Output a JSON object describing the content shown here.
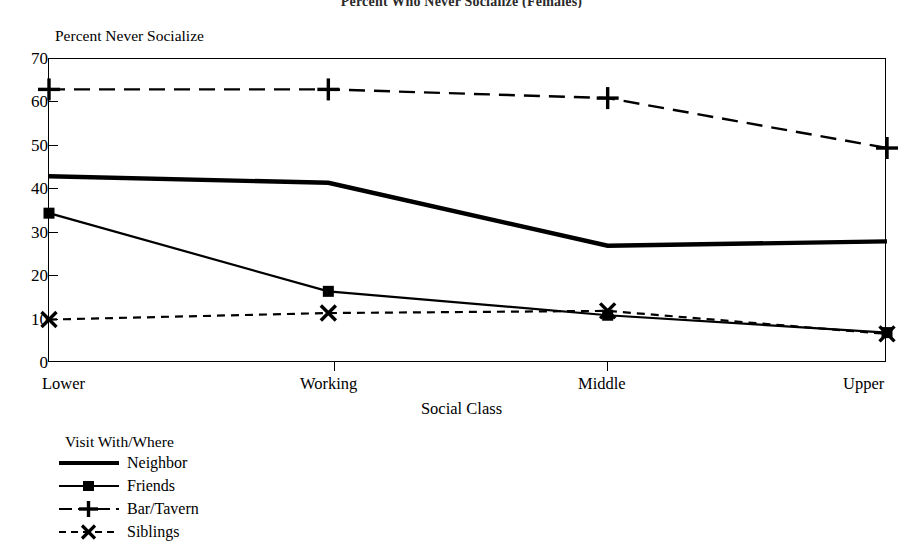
{
  "chart_data": {
    "type": "line",
    "title": "Percent Who Never Socialize (Females)",
    "xlabel": "Social Class",
    "ylabel": "Percent Never Socialize",
    "legend_title": "Visit With/Where",
    "legend_position": "below-left",
    "grid": false,
    "categories": [
      "Lower",
      "Working",
      "Middle",
      "Upper"
    ],
    "ylim": [
      0,
      70
    ],
    "yticks": [
      0,
      10,
      20,
      30,
      40,
      50,
      60,
      70
    ],
    "series": [
      {
        "name": "Neighbor",
        "values": [
          43,
          41.5,
          27,
          28
        ],
        "style": "solid-thick",
        "marker": "none"
      },
      {
        "name": "Friends",
        "values": [
          34.5,
          16.5,
          11,
          7
        ],
        "style": "solid",
        "marker": "square"
      },
      {
        "name": "Bar/Tavern",
        "values": [
          63,
          63,
          61,
          49.5
        ],
        "style": "dashed",
        "marker": "plus"
      },
      {
        "name": "Siblings",
        "values": [
          10,
          11.5,
          12,
          6.7
        ],
        "style": "dashed-short",
        "marker": "x"
      }
    ]
  },
  "axis": {
    "y_tick_labels": [
      "70",
      "60",
      "50",
      "40",
      "30",
      "20",
      "10",
      "0"
    ],
    "x_tick_labels": [
      "Lower",
      "Working",
      "Middle",
      "Upper"
    ]
  },
  "colors": {
    "ink": "#000000",
    "background": "#ffffff",
    "title": "#2b2b2b"
  }
}
